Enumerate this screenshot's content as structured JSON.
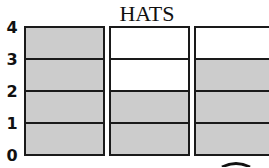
{
  "chart_data": {
    "type": "bar",
    "title": "HATS",
    "xlabel": "",
    "ylabel": "",
    "categories": [
      "Column 1",
      "Column 2",
      "Column 3"
    ],
    "values": [
      4,
      2,
      3
    ],
    "ylim": [
      0,
      4
    ],
    "yticks": [
      "0",
      "1",
      "2",
      "3",
      "4"
    ],
    "grid": true,
    "filled_color": "#cccccc",
    "empty_color": "#ffffff",
    "line_color": "#1a1a1a"
  }
}
